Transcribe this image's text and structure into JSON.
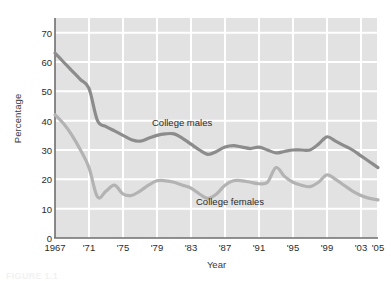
{
  "chart_data": {
    "type": "line",
    "title": "",
    "xlabel": "Year",
    "ylabel": "Percentage",
    "xlim": [
      1967,
      2005
    ],
    "ylim": [
      0,
      75
    ],
    "grid": true,
    "legend_position": "inline-annotations",
    "x_tick_labels": [
      "1967",
      "'71",
      "'75",
      "'79",
      "'83",
      "'87",
      "'91",
      "'95",
      "'99",
      "'03",
      "'05"
    ],
    "x_tick_values": [
      1967,
      1971,
      1975,
      1979,
      1983,
      1987,
      1991,
      1995,
      1999,
      2003,
      2005
    ],
    "y_tick_labels": [
      "0",
      "10",
      "20",
      "30",
      "40",
      "50",
      "60",
      "70"
    ],
    "y_tick_values": [
      0,
      10,
      20,
      30,
      40,
      50,
      60,
      70
    ],
    "x": [
      1967,
      1968,
      1969,
      1970,
      1971,
      1972,
      1973,
      1974,
      1975,
      1976,
      1977,
      1978,
      1979,
      1980,
      1981,
      1982,
      1983,
      1984,
      1985,
      1986,
      1987,
      1988,
      1989,
      1990,
      1991,
      1992,
      1993,
      1994,
      1995,
      1996,
      1997,
      1998,
      1999,
      2000,
      2001,
      2002,
      2003,
      2004,
      2005
    ],
    "series": [
      {
        "name": "College males",
        "color": "#8c8c8c",
        "values": [
          63,
          60,
          57,
          54,
          51,
          40,
          38,
          36.5,
          35,
          33.5,
          33,
          34,
          35,
          35.5,
          35.5,
          34,
          32,
          30,
          28.5,
          29.5,
          31,
          31.5,
          31,
          30.5,
          31,
          30,
          29,
          29.5,
          30,
          30,
          30,
          32,
          34.5,
          33,
          31.5,
          30,
          28,
          26,
          24
        ]
      },
      {
        "name": "College females",
        "color": "#b3b3b3",
        "values": [
          42,
          39,
          35,
          30,
          24,
          14,
          16,
          18,
          15,
          14.5,
          16,
          18,
          19.5,
          19.5,
          19,
          18,
          17,
          15,
          13.5,
          15,
          18,
          19.5,
          19.5,
          19,
          18.5,
          19,
          24,
          21,
          19,
          18,
          17.5,
          19,
          21.5,
          20,
          18,
          16,
          14.5,
          13.5,
          13
        ]
      }
    ]
  },
  "figure": {
    "caption": "FIGURE 1.1"
  },
  "colors": {
    "plot_background": "#e2e2e2",
    "gridline": "#ffffff",
    "axis_line": "#6e6e6e",
    "series_males": "#8c8c8c",
    "series_females": "#b3b3b3",
    "text": "#2b2b2b"
  }
}
